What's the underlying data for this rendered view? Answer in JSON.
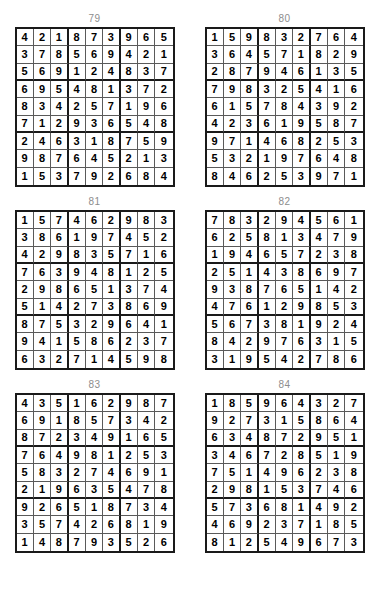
{
  "page": {
    "kind": "sudoku-solutions-page",
    "columns": 2,
    "rows_of_puzzles": 3,
    "grid_size": 9,
    "title_color": "#8d8d8d",
    "digit_color": "#000000",
    "thick_line_color": "#1a1a1a",
    "thin_line_color": "#5a5a5a",
    "background_color": "#ffffff"
  },
  "puzzles": [
    {
      "number": "79",
      "grid": [
        [
          "4",
          "2",
          "1",
          "8",
          "7",
          "3",
          "9",
          "6",
          "5"
        ],
        [
          "3",
          "7",
          "8",
          "5",
          "6",
          "9",
          "4",
          "2",
          "1"
        ],
        [
          "5",
          "6",
          "9",
          "1",
          "2",
          "4",
          "8",
          "3",
          "7"
        ],
        [
          "6",
          "9",
          "5",
          "4",
          "8",
          "1",
          "3",
          "7",
          "2"
        ],
        [
          "8",
          "3",
          "4",
          "2",
          "5",
          "7",
          "1",
          "9",
          "6"
        ],
        [
          "7",
          "1",
          "2",
          "9",
          "3",
          "6",
          "5",
          "4",
          "8"
        ],
        [
          "2",
          "4",
          "6",
          "3",
          "1",
          "8",
          "7",
          "5",
          "9"
        ],
        [
          "9",
          "8",
          "7",
          "6",
          "4",
          "5",
          "2",
          "1",
          "3"
        ],
        [
          "1",
          "5",
          "3",
          "7",
          "9",
          "2",
          "6",
          "8",
          "4"
        ]
      ]
    },
    {
      "number": "80",
      "grid": [
        [
          "1",
          "5",
          "9",
          "8",
          "3",
          "2",
          "7",
          "6",
          "4"
        ],
        [
          "3",
          "6",
          "4",
          "5",
          "7",
          "1",
          "8",
          "2",
          "9"
        ],
        [
          "2",
          "8",
          "7",
          "9",
          "4",
          "6",
          "1",
          "3",
          "5"
        ],
        [
          "7",
          "9",
          "8",
          "3",
          "2",
          "5",
          "4",
          "1",
          "6"
        ],
        [
          "6",
          "1",
          "5",
          "7",
          "8",
          "4",
          "3",
          "9",
          "2"
        ],
        [
          "4",
          "2",
          "3",
          "6",
          "1",
          "9",
          "5",
          "8",
          "7"
        ],
        [
          "9",
          "7",
          "1",
          "4",
          "6",
          "8",
          "2",
          "5",
          "3"
        ],
        [
          "5",
          "3",
          "2",
          "1",
          "9",
          "7",
          "6",
          "4",
          "8"
        ],
        [
          "8",
          "4",
          "6",
          "2",
          "5",
          "3",
          "9",
          "7",
          "1"
        ]
      ]
    },
    {
      "number": "81",
      "grid": [
        [
          "1",
          "5",
          "7",
          "4",
          "6",
          "2",
          "9",
          "8",
          "3"
        ],
        [
          "3",
          "8",
          "6",
          "1",
          "9",
          "7",
          "4",
          "5",
          "2"
        ],
        [
          "4",
          "2",
          "9",
          "8",
          "3",
          "5",
          "7",
          "1",
          "6"
        ],
        [
          "7",
          "6",
          "3",
          "9",
          "4",
          "8",
          "1",
          "2",
          "5"
        ],
        [
          "2",
          "9",
          "8",
          "6",
          "5",
          "1",
          "3",
          "7",
          "4"
        ],
        [
          "5",
          "1",
          "4",
          "2",
          "7",
          "3",
          "8",
          "6",
          "9"
        ],
        [
          "8",
          "7",
          "5",
          "3",
          "2",
          "9",
          "6",
          "4",
          "1"
        ],
        [
          "9",
          "4",
          "1",
          "5",
          "8",
          "6",
          "2",
          "3",
          "7"
        ],
        [
          "6",
          "3",
          "2",
          "7",
          "1",
          "4",
          "5",
          "9",
          "8"
        ]
      ]
    },
    {
      "number": "82",
      "grid": [
        [
          "7",
          "8",
          "3",
          "2",
          "9",
          "4",
          "5",
          "6",
          "1"
        ],
        [
          "6",
          "2",
          "5",
          "8",
          "1",
          "3",
          "4",
          "7",
          "9"
        ],
        [
          "1",
          "9",
          "4",
          "6",
          "5",
          "7",
          "2",
          "3",
          "8"
        ],
        [
          "2",
          "5",
          "1",
          "4",
          "3",
          "8",
          "6",
          "9",
          "7"
        ],
        [
          "9",
          "3",
          "8",
          "7",
          "6",
          "5",
          "1",
          "4",
          "2"
        ],
        [
          "4",
          "7",
          "6",
          "1",
          "2",
          "9",
          "8",
          "5",
          "3"
        ],
        [
          "5",
          "6",
          "7",
          "3",
          "8",
          "1",
          "9",
          "2",
          "4"
        ],
        [
          "8",
          "4",
          "2",
          "9",
          "7",
          "6",
          "3",
          "1",
          "5"
        ],
        [
          "3",
          "1",
          "9",
          "5",
          "4",
          "2",
          "7",
          "8",
          "6"
        ]
      ]
    },
    {
      "number": "83",
      "grid": [
        [
          "4",
          "3",
          "5",
          "1",
          "6",
          "2",
          "9",
          "8",
          "7"
        ],
        [
          "6",
          "9",
          "1",
          "8",
          "5",
          "7",
          "3",
          "4",
          "2"
        ],
        [
          "8",
          "7",
          "2",
          "3",
          "4",
          "9",
          "1",
          "6",
          "5"
        ],
        [
          "7",
          "6",
          "4",
          "9",
          "8",
          "1",
          "2",
          "5",
          "3"
        ],
        [
          "5",
          "8",
          "3",
          "2",
          "7",
          "4",
          "6",
          "9",
          "1"
        ],
        [
          "2",
          "1",
          "9",
          "6",
          "3",
          "5",
          "4",
          "7",
          "8"
        ],
        [
          "9",
          "2",
          "6",
          "5",
          "1",
          "8",
          "7",
          "3",
          "4"
        ],
        [
          "3",
          "5",
          "7",
          "4",
          "2",
          "6",
          "8",
          "1",
          "9"
        ],
        [
          "1",
          "4",
          "8",
          "7",
          "9",
          "3",
          "5",
          "2",
          "6"
        ]
      ]
    },
    {
      "number": "84",
      "grid": [
        [
          "1",
          "8",
          "5",
          "9",
          "6",
          "4",
          "3",
          "2",
          "7"
        ],
        [
          "9",
          "2",
          "7",
          "3",
          "1",
          "5",
          "8",
          "6",
          "4"
        ],
        [
          "6",
          "3",
          "4",
          "8",
          "7",
          "2",
          "9",
          "5",
          "1"
        ],
        [
          "3",
          "4",
          "6",
          "7",
          "2",
          "8",
          "5",
          "1",
          "9"
        ],
        [
          "7",
          "5",
          "1",
          "4",
          "9",
          "6",
          "2",
          "3",
          "8"
        ],
        [
          "2",
          "9",
          "8",
          "1",
          "5",
          "3",
          "7",
          "4",
          "6"
        ],
        [
          "5",
          "7",
          "3",
          "6",
          "8",
          "1",
          "4",
          "9",
          "2"
        ],
        [
          "4",
          "6",
          "9",
          "2",
          "3",
          "7",
          "1",
          "8",
          "5"
        ],
        [
          "8",
          "1",
          "2",
          "5",
          "4",
          "9",
          "6",
          "7",
          "3"
        ]
      ]
    }
  ]
}
